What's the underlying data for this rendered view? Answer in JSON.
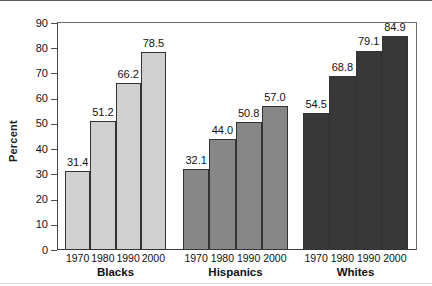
{
  "chart_data": {
    "type": "bar",
    "title": "",
    "xlabel": "",
    "ylabel": "Percent",
    "ylim": [
      0,
      90
    ],
    "yticks": [
      0,
      10,
      20,
      30,
      40,
      50,
      60,
      70,
      80,
      90
    ],
    "ytick_labels": [
      "0",
      "10",
      "20",
      "30",
      "40",
      "50",
      "60",
      "70",
      "80",
      "90"
    ],
    "grid": false,
    "legend_position": "none",
    "categories": [
      "1970",
      "1980",
      "1990",
      "2000"
    ],
    "groups": [
      {
        "name": "Blacks",
        "color": "#d0d0d0",
        "categories": [
          "1970",
          "1980",
          "1990",
          "2000"
        ],
        "values": [
          31.4,
          51.2,
          66.2,
          78.5
        ],
        "value_labels": [
          "31.4",
          "51.2",
          "66.2",
          "78.5"
        ]
      },
      {
        "name": "Hispanics",
        "color": "#878787",
        "categories": [
          "1970",
          "1980",
          "1990",
          "2000"
        ],
        "values": [
          32.1,
          44.0,
          50.8,
          57.0
        ],
        "value_labels": [
          "32.1",
          "44.0",
          "50.8",
          "57.0"
        ]
      },
      {
        "name": "Whites",
        "color": "#383838",
        "categories": [
          "1970",
          "1980",
          "1990",
          "2000"
        ],
        "values": [
          54.5,
          68.8,
          79.1,
          84.9
        ],
        "value_labels": [
          "54.5",
          "68.8",
          "79.1",
          "84.9"
        ]
      }
    ]
  },
  "axis": {
    "y_title": "Percent"
  }
}
